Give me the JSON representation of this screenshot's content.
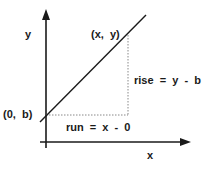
{
  "diagram": {
    "axes": {
      "x_label": "x",
      "y_label": "y"
    },
    "points": {
      "intercept": "(0,  b)",
      "end": "(x,  y)"
    },
    "annotations": {
      "rise": "rise  =  y  -  b",
      "run": "run  =  x  -  0"
    },
    "colors": {
      "ink": "#1a1a1a",
      "dotted": "#888888"
    }
  }
}
